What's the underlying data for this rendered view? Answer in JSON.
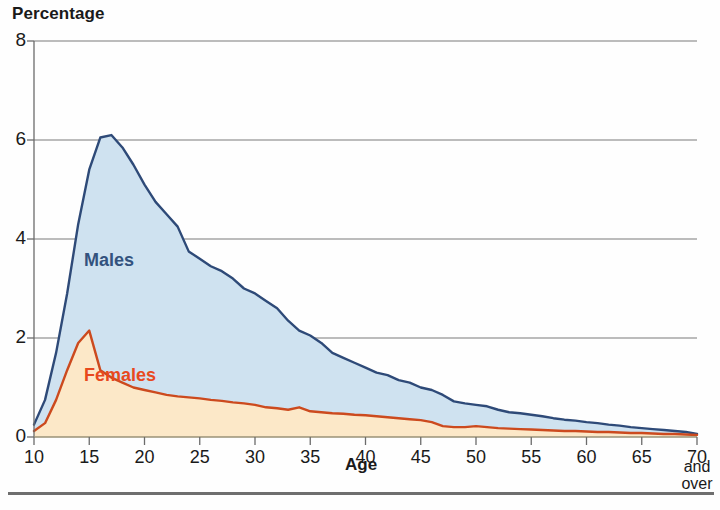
{
  "chart_data": {
    "type": "area",
    "title": "Percentage",
    "xlabel": "Age",
    "ylabel": "",
    "xlim": [
      10,
      70
    ],
    "ylim": [
      0,
      8
    ],
    "grid": true,
    "grid_axis": "y",
    "legend_position": "inline-annotation",
    "x_tick_labels": [
      "10",
      "15",
      "20",
      "25",
      "30",
      "35",
      "40",
      "45",
      "50",
      "55",
      "60",
      "65",
      "70"
    ],
    "x_last_tick_note": [
      "and",
      "over"
    ],
    "y_tick_labels": [
      "0",
      "2",
      "4",
      "6",
      "8"
    ],
    "x": [
      10,
      11,
      12,
      13,
      14,
      15,
      16,
      17,
      18,
      19,
      20,
      21,
      22,
      23,
      24,
      25,
      26,
      27,
      28,
      29,
      30,
      31,
      32,
      33,
      34,
      35,
      36,
      37,
      38,
      39,
      40,
      41,
      42,
      43,
      44,
      45,
      46,
      47,
      48,
      49,
      50,
      51,
      52,
      53,
      54,
      55,
      56,
      57,
      58,
      59,
      60,
      61,
      62,
      63,
      64,
      65,
      66,
      67,
      68,
      69,
      70
    ],
    "series": [
      {
        "name": "Males",
        "color": "#2e4a78",
        "fill": "#cfe2f0",
        "values": [
          0.25,
          0.75,
          1.7,
          2.9,
          4.3,
          5.4,
          6.05,
          6.1,
          5.85,
          5.5,
          5.1,
          4.75,
          4.5,
          4.25,
          3.75,
          3.6,
          3.45,
          3.35,
          3.2,
          3.0,
          2.9,
          2.75,
          2.6,
          2.35,
          2.15,
          2.05,
          1.9,
          1.7,
          1.6,
          1.5,
          1.4,
          1.3,
          1.25,
          1.15,
          1.1,
          1.0,
          0.95,
          0.85,
          0.72,
          0.68,
          0.65,
          0.62,
          0.55,
          0.5,
          0.48,
          0.45,
          0.42,
          0.38,
          0.35,
          0.33,
          0.3,
          0.28,
          0.25,
          0.23,
          0.2,
          0.18,
          0.16,
          0.14,
          0.12,
          0.1,
          0.06
        ]
      },
      {
        "name": "Females",
        "color": "#cc4a1e",
        "fill": "#fce8c8",
        "values": [
          0.12,
          0.28,
          0.75,
          1.35,
          1.9,
          2.15,
          1.35,
          1.2,
          1.1,
          1.0,
          0.95,
          0.9,
          0.85,
          0.82,
          0.8,
          0.78,
          0.75,
          0.73,
          0.7,
          0.68,
          0.65,
          0.6,
          0.58,
          0.55,
          0.6,
          0.52,
          0.5,
          0.48,
          0.47,
          0.45,
          0.44,
          0.42,
          0.4,
          0.38,
          0.36,
          0.34,
          0.3,
          0.22,
          0.2,
          0.2,
          0.22,
          0.2,
          0.18,
          0.17,
          0.16,
          0.15,
          0.14,
          0.13,
          0.12,
          0.12,
          0.11,
          0.1,
          0.1,
          0.09,
          0.08,
          0.08,
          0.07,
          0.06,
          0.06,
          0.05,
          0.04
        ]
      }
    ],
    "annotations": [
      {
        "text": "Males",
        "color": "#33527e"
      },
      {
        "text": "Females",
        "color": "#e8491e"
      }
    ]
  },
  "labels": {
    "males": "Males",
    "females": "Females"
  }
}
